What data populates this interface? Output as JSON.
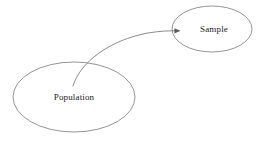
{
  "canvas": {
    "width": 261,
    "height": 146,
    "background_color": "#ffffff"
  },
  "diagram": {
    "type": "node-link",
    "stroke_color": "#7a7a7a",
    "text_color": "#1a1a1a",
    "arrow_color": "#5e5e5e"
  },
  "nodes": [
    {
      "id": "population",
      "label": "Population",
      "shape": "ellipse",
      "cx": 74,
      "cy": 97,
      "rx": 61,
      "ry": 35,
      "label_x": 74,
      "label_y": 98
    },
    {
      "id": "sample",
      "label": "Sample",
      "shape": "ellipse",
      "cx": 212,
      "cy": 29,
      "rx": 40,
      "ry": 23,
      "label_x": 214,
      "label_y": 30
    }
  ],
  "edges": [
    {
      "id": "population-to-sample",
      "from": "population",
      "to": "sample",
      "style": "curved",
      "arrowhead": "solid-triangle",
      "path": "M 73 86 C 80 62 110 40 148 33 C 160 31 170 30.6 179 30.8",
      "arrow_points": "180.5,30.8 174.4,28.2 174.4,33.5"
    }
  ]
}
